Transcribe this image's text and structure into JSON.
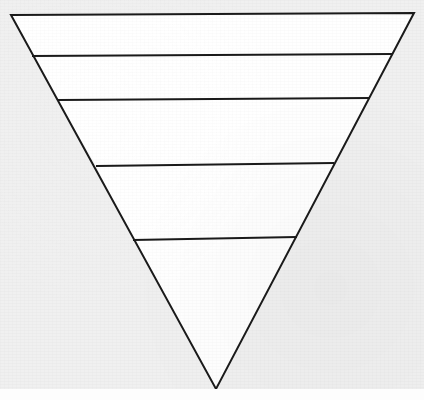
{
  "figure": {
    "canvas": {
      "width": 424,
      "height": 400
    },
    "colors": {
      "background": "#f0f0f0",
      "bottom_margin": "#fdfdfd",
      "shape_fill": "#ffffff",
      "stroke": "#1a1a1a"
    },
    "stroke_width": 2.0,
    "divider_stroke_width": 2.0,
    "outline": {
      "name": "inverted-triangle-outline",
      "points": "11,15 414,13 216,389",
      "vertices": [
        {
          "name": "top-left",
          "x": 11,
          "y": 15
        },
        {
          "name": "top-right",
          "x": 414,
          "y": 13
        },
        {
          "name": "bottom-apex",
          "x": 216,
          "y": 389
        }
      ]
    },
    "dividers": [
      {
        "name": "divider-1",
        "x1": 32,
        "y1": 56,
        "x2": 392,
        "y2": 54
      },
      {
        "name": "divider-2",
        "x1": 58,
        "y1": 100,
        "x2": 370,
        "y2": 98
      },
      {
        "name": "divider-3",
        "x1": 96,
        "y1": 166,
        "x2": 334,
        "y2": 163
      },
      {
        "name": "divider-4",
        "x1": 133,
        "y1": 240,
        "x2": 297,
        "y2": 237
      }
    ],
    "bands": [
      {
        "name": "band-1",
        "index": 1,
        "label": "",
        "points": "11,15 414,13 392,54 32,56"
      },
      {
        "name": "band-2",
        "index": 2,
        "label": "",
        "points": "32,56 392,54 370,98 58,100"
      },
      {
        "name": "band-3",
        "index": 3,
        "label": "",
        "points": "58,100 370,98 334,163 96,166"
      },
      {
        "name": "band-4",
        "index": 4,
        "label": "",
        "points": "96,166 334,163 297,237 133,240"
      },
      {
        "name": "band-5",
        "index": 5,
        "label": "",
        "points": "133,240 297,237 216,389"
      }
    ]
  }
}
